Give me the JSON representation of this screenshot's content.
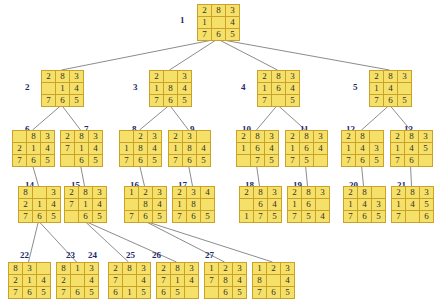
{
  "diagram": {
    "colors": {
      "tile_fill": "#f5e16a",
      "tile_border": "#c9a227",
      "label_color": "#1d2b6b",
      "edge_color": "#6e6e6e",
      "background": "#ffffff"
    },
    "blank_symbol": "",
    "nodes": [
      {
        "id": "1",
        "label": "1",
        "x": 197,
        "y": 4,
        "label_x": 180,
        "label_y": 15,
        "state": [
          "2",
          "8",
          "3",
          "1",
          "",
          "4",
          "7",
          "6",
          "5"
        ]
      },
      {
        "id": "2",
        "label": "2",
        "x": 41,
        "y": 70,
        "label_x": 25,
        "label_y": 82,
        "state": [
          "2",
          "8",
          "3",
          "",
          "1",
          "4",
          "7",
          "6",
          "5"
        ]
      },
      {
        "id": "3",
        "label": "3",
        "x": 149,
        "y": 70,
        "label_x": 133,
        "label_y": 82,
        "state": [
          "2",
          "",
          "3",
          "1",
          "8",
          "4",
          "7",
          "6",
          "5"
        ]
      },
      {
        "id": "4",
        "label": "4",
        "x": 257,
        "y": 70,
        "label_x": 241,
        "label_y": 82,
        "state": [
          "2",
          "8",
          "3",
          "1",
          "6",
          "4",
          "7",
          "",
          "5"
        ]
      },
      {
        "id": "5",
        "label": "5",
        "x": 369,
        "y": 70,
        "label_x": 353,
        "label_y": 82,
        "state": [
          "2",
          "8",
          "3",
          "1",
          "4",
          "",
          "7",
          "6",
          "5"
        ]
      },
      {
        "id": "6",
        "label": "6",
        "x": 12,
        "y": 130,
        "label_x": 25,
        "label_y": 124,
        "state": [
          "",
          "8",
          "3",
          "2",
          "1",
          "4",
          "7",
          "6",
          "5"
        ]
      },
      {
        "id": "7",
        "label": "7",
        "x": 60,
        "y": 130,
        "label_x": 84,
        "label_y": 124,
        "state": [
          "2",
          "8",
          "3",
          "7",
          "1",
          "4",
          "",
          "6",
          "5"
        ]
      },
      {
        "id": "8",
        "label": "8",
        "x": 119,
        "y": 130,
        "label_x": 132,
        "label_y": 124,
        "state": [
          "",
          "2",
          "3",
          "1",
          "8",
          "4",
          "7",
          "6",
          "5"
        ]
      },
      {
        "id": "9",
        "label": "9",
        "x": 168,
        "y": 130,
        "label_x": 190,
        "label_y": 124,
        "state": [
          "2",
          "3",
          "",
          "1",
          "8",
          "4",
          "7",
          "6",
          "5"
        ]
      },
      {
        "id": "10",
        "label": "10",
        "x": 236,
        "y": 130,
        "label_x": 242,
        "label_y": 124,
        "state": [
          "2",
          "8",
          "3",
          "1",
          "6",
          "4",
          "",
          "7",
          "5"
        ]
      },
      {
        "id": "11",
        "label": "11",
        "x": 285,
        "y": 130,
        "label_x": 300,
        "label_y": 124,
        "state": [
          "2",
          "8",
          "3",
          "1",
          "6",
          "4",
          "7",
          "5",
          ""
        ]
      },
      {
        "id": "12",
        "label": "12",
        "x": 341,
        "y": 130,
        "label_x": 346,
        "label_y": 124,
        "state": [
          "2",
          "8",
          "",
          "1",
          "4",
          "3",
          "7",
          "6",
          "5"
        ]
      },
      {
        "id": "13",
        "label": "13",
        "x": 390,
        "y": 130,
        "label_x": 404,
        "label_y": 124,
        "state": [
          "2",
          "8",
          "3",
          "1",
          "4",
          "5",
          "7",
          "6",
          ""
        ]
      },
      {
        "id": "14",
        "label": "14",
        "x": 18,
        "y": 186,
        "label_x": 25,
        "label_y": 180,
        "state": [
          "8",
          "",
          "3",
          "2",
          "1",
          "4",
          "7",
          "6",
          "5"
        ]
      },
      {
        "id": "15",
        "label": "15",
        "x": 64,
        "y": 186,
        "label_x": 71,
        "label_y": 180,
        "state": [
          "2",
          "8",
          "3",
          "7",
          "1",
          "4",
          "",
          "6",
          "5"
        ]
      },
      {
        "id": "16",
        "label": "16",
        "x": 124,
        "y": 186,
        "label_x": 130,
        "label_y": 180,
        "state": [
          "1",
          "2",
          "3",
          "",
          "8",
          "4",
          "7",
          "6",
          "5"
        ]
      },
      {
        "id": "17",
        "label": "17",
        "x": 172,
        "y": 186,
        "label_x": 178,
        "label_y": 180,
        "state": [
          "2",
          "3",
          "4",
          "1",
          "8",
          "",
          "7",
          "6",
          "5"
        ]
      },
      {
        "id": "18",
        "label": "18",
        "x": 239,
        "y": 186,
        "label_x": 245,
        "label_y": 180,
        "state": [
          "2",
          "8",
          "3",
          "",
          "6",
          "4",
          "1",
          "7",
          "5"
        ]
      },
      {
        "id": "19",
        "label": "19",
        "x": 287,
        "y": 186,
        "label_x": 293,
        "label_y": 180,
        "state": [
          "2",
          "8",
          "3",
          "1",
          "6",
          "",
          "7",
          "5",
          "4"
        ]
      },
      {
        "id": "20",
        "label": "20",
        "x": 343,
        "y": 186,
        "label_x": 349,
        "label_y": 180,
        "state": [
          "2",
          "8",
          "",
          "1",
          "4",
          "3",
          "7",
          "6",
          "5"
        ]
      },
      {
        "id": "21",
        "label": "21",
        "x": 391,
        "y": 186,
        "label_x": 397,
        "label_y": 180,
        "state": [
          "2",
          "8",
          "3",
          "1",
          "4",
          "5",
          "7",
          "",
          "6"
        ]
      },
      {
        "id": "22",
        "label": "22",
        "x": 8,
        "y": 262,
        "label_x": 20,
        "label_y": 250,
        "state": [
          "8",
          "3",
          "",
          "2",
          "1",
          "4",
          "7",
          "6",
          "5"
        ]
      },
      {
        "id": "23",
        "label": "23",
        "x": 56,
        "y": 262,
        "label_x": 66,
        "label_y": 250,
        "state": [
          "8",
          "1",
          "3",
          "2",
          "",
          "4",
          "7",
          "6",
          "5"
        ]
      },
      {
        "id": "24",
        "label": "24",
        "x": 108,
        "y": 262,
        "label_x": 88,
        "label_y": 250,
        "state": [
          "2",
          "8",
          "3",
          "7",
          "",
          "4",
          "6",
          "1",
          "5"
        ]
      },
      {
        "id": "25",
        "label": "25",
        "x": 156,
        "y": 262,
        "label_x": 126,
        "label_y": 250,
        "state": [
          "2",
          "8",
          "3",
          "7",
          "1",
          "4",
          "6",
          "5",
          ""
        ]
      },
      {
        "id": "26",
        "label": "26",
        "x": 204,
        "y": 262,
        "label_x": 152,
        "label_y": 250,
        "state": [
          "1",
          "2",
          "3",
          "7",
          "8",
          "4",
          "",
          "6",
          "5"
        ]
      },
      {
        "id": "27",
        "label": "27",
        "x": 252,
        "y": 262,
        "label_x": 205,
        "label_y": 250,
        "state": [
          "1",
          "2",
          "3",
          "8",
          "",
          "4",
          "7",
          "6",
          "5"
        ]
      }
    ],
    "edges": [
      {
        "from": "1",
        "to": "2"
      },
      {
        "from": "1",
        "to": "3"
      },
      {
        "from": "1",
        "to": "4"
      },
      {
        "from": "1",
        "to": "5"
      },
      {
        "from": "2",
        "to": "6"
      },
      {
        "from": "2",
        "to": "7"
      },
      {
        "from": "3",
        "to": "8"
      },
      {
        "from": "3",
        "to": "9"
      },
      {
        "from": "4",
        "to": "10"
      },
      {
        "from": "4",
        "to": "11"
      },
      {
        "from": "5",
        "to": "12"
      },
      {
        "from": "5",
        "to": "13"
      },
      {
        "from": "6",
        "to": "14"
      },
      {
        "from": "7",
        "to": "15"
      },
      {
        "from": "8",
        "to": "16"
      },
      {
        "from": "9",
        "to": "17"
      },
      {
        "from": "10",
        "to": "18"
      },
      {
        "from": "11",
        "to": "19"
      },
      {
        "from": "12",
        "to": "20"
      },
      {
        "from": "13",
        "to": "21"
      },
      {
        "from": "14",
        "to": "22"
      },
      {
        "from": "14",
        "to": "23"
      },
      {
        "from": "15",
        "to": "24"
      },
      {
        "from": "15",
        "to": "25"
      },
      {
        "from": "16",
        "to": "26"
      },
      {
        "from": "16",
        "to": "27"
      }
    ]
  }
}
